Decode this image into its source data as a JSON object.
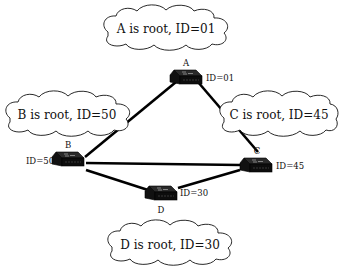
{
  "diagram": {
    "switches": [
      {
        "key": "A",
        "name": "A",
        "id_label": "ID=01",
        "cloud": "A is root, ID=01"
      },
      {
        "key": "B",
        "name": "B",
        "id_label": "ID=50",
        "cloud": "B is root, ID=50"
      },
      {
        "key": "C",
        "name": "C",
        "id_label": "ID=45",
        "cloud": "C is root, ID=45"
      },
      {
        "key": "D",
        "name": "D",
        "id_label": "ID=30",
        "cloud": "D is root, ID=30"
      }
    ],
    "links": [
      {
        "from": "A",
        "to": "B"
      },
      {
        "from": "A",
        "to": "C"
      },
      {
        "from": "B",
        "to": "C"
      },
      {
        "from": "B",
        "to": "D"
      },
      {
        "from": "C",
        "to": "D"
      }
    ]
  }
}
